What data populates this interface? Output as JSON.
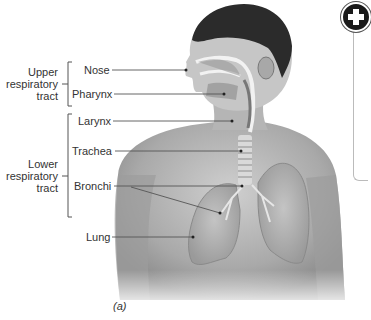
{
  "figure": {
    "caption": "(a)",
    "groups": [
      {
        "id": "upper",
        "label_lines": [
          "Upper",
          "respiratory",
          "tract"
        ],
        "items": [
          "nose",
          "pharynx"
        ]
      },
      {
        "id": "lower",
        "label_lines": [
          "Lower",
          "respiratory",
          "tract"
        ],
        "items": [
          "larynx",
          "trachea",
          "bronchi",
          "lung"
        ]
      }
    ],
    "labels": {
      "nose": "Nose",
      "pharynx": "Pharynx",
      "larynx": "Larynx",
      "trachea": "Trachea",
      "bronchi": "Bronchi",
      "lung": "Lung"
    },
    "upper_group": {
      "line1": "Upper",
      "line2": "respiratory",
      "line3": "tract"
    },
    "lower_group": {
      "line1": "Lower",
      "line2": "respiratory",
      "line3": "tract"
    }
  },
  "controls": {
    "expand_icon": "plus-circle-icon"
  },
  "colors": {
    "text": "#333333",
    "leader_line": "#555555",
    "skin_light": "#d6d6d6",
    "skin_dark": "#8a8a8a",
    "hair": "#2b2b2b"
  }
}
